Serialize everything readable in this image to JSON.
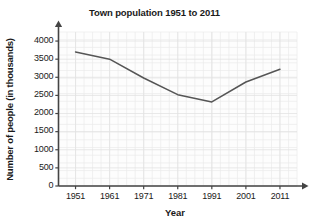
{
  "chart_data": {
    "type": "line",
    "title": "Town population 1951 to 2011",
    "xlabel": "Year",
    "ylabel": "Number of people (in thousands)",
    "categories": [
      "1951",
      "1961",
      "1971",
      "1981",
      "1991",
      "2001",
      "2011"
    ],
    "x": [
      1951,
      1961,
      1971,
      1981,
      1991,
      2001,
      2011
    ],
    "values": [
      3700,
      3500,
      2980,
      2520,
      2320,
      2870,
      3220
    ],
    "series": [
      {
        "name": "Town population",
        "values": [
          3700,
          3500,
          2980,
          2520,
          2320,
          2870,
          3220
        ]
      }
    ],
    "ylim": [
      0,
      4250
    ],
    "xlim": [
      1946,
      2016
    ],
    "yticks": [
      0,
      500,
      1000,
      1500,
      2000,
      2500,
      3000,
      3500,
      4000
    ],
    "ytick_labels": [
      "0",
      "500",
      "1000",
      "1500",
      "2000",
      "2500",
      "3000",
      "3500",
      "4000"
    ],
    "xticks": [
      1951,
      1961,
      1971,
      1981,
      1991,
      2001,
      2011
    ],
    "xtick_labels": [
      "1951",
      "1961",
      "1971",
      "1981",
      "1991",
      "2001",
      "2011"
    ],
    "grid": true,
    "legend": "none",
    "line_color": "#555555",
    "grid_color": "#ebebeb",
    "axis_color": "#444444",
    "background_color": "#fdfdfd",
    "markers": false
  }
}
